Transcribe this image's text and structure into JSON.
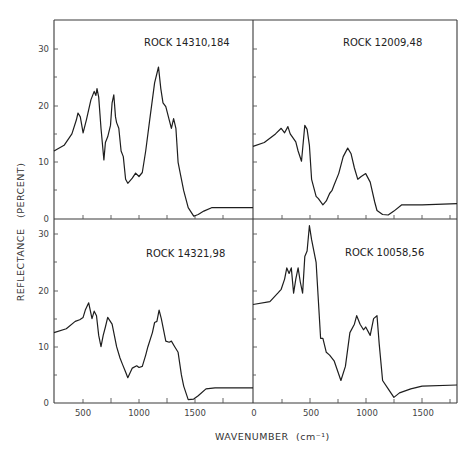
{
  "chart_data": {
    "type": "line",
    "layout": "2x2 panel grid, shared axes",
    "xlabel": "WAVENUMBER (cm-1)",
    "ylabel": "REFLECTANCE (PERCENT)",
    "grid": false,
    "panels": [
      {
        "id": "top-left",
        "title": "ROCK 14310,184",
        "xlim": [
          240,
          2020
        ],
        "ylim": [
          0,
          35
        ],
        "yticks": [
          0,
          10,
          20,
          30
        ],
        "x": [
          240,
          330,
          400,
          440,
          455,
          475,
          500,
          530,
          570,
          600,
          615,
          625,
          640,
          660,
          686,
          700,
          720,
          745,
          760,
          775,
          790,
          800,
          820,
          840,
          860,
          880,
          900,
          940,
          970,
          1000,
          1030,
          1060,
          1100,
          1140,
          1175,
          1195,
          1215,
          1240,
          1270,
          1290,
          1310,
          1330,
          1350,
          1370,
          1400,
          1440,
          1490,
          1530,
          1580,
          1650,
          2020
        ],
        "values": [
          12,
          13,
          15,
          17.5,
          18.7,
          18,
          15.2,
          17.5,
          21,
          22.5,
          21.8,
          23,
          21.5,
          16,
          10.4,
          13.5,
          14.5,
          16.5,
          20.5,
          21.9,
          18,
          17,
          16,
          12,
          11,
          7,
          6.3,
          7.2,
          8.1,
          7.5,
          8.2,
          12,
          18,
          24,
          26.8,
          23,
          20.5,
          19.8,
          17.5,
          16,
          17.7,
          16,
          10,
          8,
          5,
          2,
          0.5,
          0.8,
          1.4,
          2,
          2
        ]
      },
      {
        "id": "top-right",
        "title": "ROCK 12009,48",
        "xlim": [
          0,
          1810
        ],
        "ylim": [
          0,
          35
        ],
        "yticks": [
          0,
          10,
          20,
          30
        ],
        "x": [
          0,
          100,
          200,
          250,
          280,
          310,
          330,
          380,
          400,
          430,
          460,
          480,
          500,
          520,
          560,
          580,
          620,
          650,
          680,
          700,
          720,
          760,
          800,
          840,
          870,
          900,
          930,
          960,
          1000,
          1040,
          1080,
          1100,
          1150,
          1200,
          1250,
          1320,
          1500,
          1810
        ],
        "values": [
          12.8,
          13.5,
          15,
          16,
          15.2,
          16.3,
          15,
          13.6,
          12,
          10.2,
          16.5,
          15.8,
          13,
          7,
          4,
          3.6,
          2.5,
          3.2,
          4.5,
          5,
          6,
          8,
          11,
          12.5,
          11.5,
          9,
          7,
          7.5,
          8,
          6.5,
          3,
          1.5,
          0.8,
          0.7,
          1.4,
          2.5,
          2.5,
          2.7
        ]
      },
      {
        "id": "bottom-left",
        "title": "ROCK 14321,98",
        "xlim": [
          240,
          2020
        ],
        "ylim": [
          0,
          30
        ],
        "yticks": [
          0,
          10,
          20,
          30
        ],
        "x": [
          240,
          350,
          430,
          470,
          500,
          520,
          550,
          580,
          600,
          620,
          640,
          660,
          680,
          700,
          720,
          760,
          800,
          830,
          850,
          880,
          900,
          940,
          980,
          1000,
          1030,
          1060,
          1080,
          1120,
          1140,
          1160,
          1180,
          1200,
          1240,
          1270,
          1290,
          1320,
          1350,
          1380,
          1400,
          1440,
          1490,
          1530,
          1600,
          1680,
          2020
        ],
        "values": [
          12.5,
          13.2,
          14.5,
          14.8,
          15.2,
          16.5,
          17.8,
          15,
          16.3,
          15.5,
          12,
          10,
          12,
          13.5,
          15.2,
          14,
          10,
          8,
          7,
          5.5,
          4.5,
          6.2,
          6.6,
          6.3,
          6.5,
          8.5,
          10,
          12.5,
          14.3,
          14.5,
          16.5,
          15,
          11,
          10.8,
          11,
          10,
          9,
          5,
          3,
          0.6,
          0.7,
          1.3,
          2.5,
          2.7,
          2.7
        ]
      },
      {
        "id": "bottom-right",
        "title": "ROCK 10058,56",
        "xlim": [
          0,
          1810
        ],
        "ylim": [
          0,
          31
        ],
        "yticks": [
          0,
          10,
          20,
          30
        ],
        "x": [
          0,
          150,
          220,
          250,
          280,
          300,
          320,
          340,
          360,
          380,
          400,
          420,
          440,
          460,
          480,
          500,
          520,
          560,
          600,
          620,
          650,
          680,
          720,
          780,
          820,
          860,
          900,
          920,
          950,
          980,
          1000,
          1040,
          1070,
          1100,
          1120,
          1150,
          1200,
          1250,
          1300,
          1400,
          1500,
          1810
        ],
        "values": [
          17.5,
          18,
          19.5,
          20.2,
          22,
          24,
          23,
          24,
          19.5,
          22,
          24,
          21.5,
          19.5,
          26,
          27,
          31.5,
          29,
          25,
          11.5,
          11.5,
          9,
          8.5,
          7.5,
          4,
          6.5,
          12.5,
          14,
          15.5,
          14,
          13,
          13.5,
          12,
          15,
          15.5,
          10.5,
          4,
          2.5,
          1,
          1.8,
          2.5,
          3,
          3.2
        ]
      }
    ]
  },
  "panels": {
    "tl_title": "ROCK 14310,184",
    "tr_title": "ROCK 12009,48",
    "bl_title": "ROCK 14321,98",
    "br_title": "ROCK 10058,56"
  },
  "axes": {
    "ylabel": "REFLECTANCE   (PERCENT)",
    "xlabel": "WAVENUMBER",
    "xunit": "(cm⁻¹)",
    "top_yticks": [
      "30",
      "20",
      "10",
      "0"
    ],
    "bottom_yticks": [
      "30",
      "20",
      "10",
      "0"
    ],
    "left_xticks": [
      "500",
      "1000",
      "1500"
    ],
    "right_xticks": [
      "0",
      "500",
      "1000",
      "1500"
    ]
  }
}
